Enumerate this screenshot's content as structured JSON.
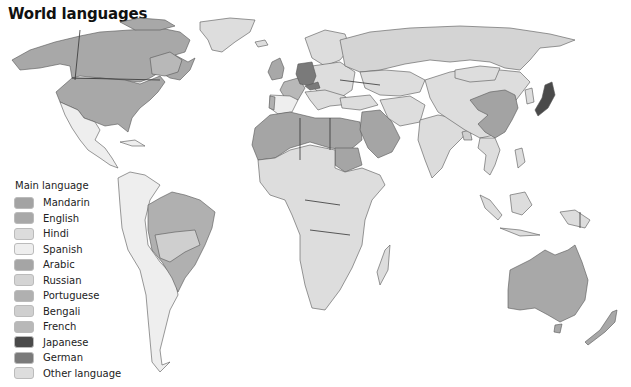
{
  "title": "World languages",
  "legend": {
    "title": "Main language",
    "items": [
      {
        "label": "Mandarin",
        "color": "#a3a3a3"
      },
      {
        "label": "English",
        "color": "#a8a8a8"
      },
      {
        "label": "Hindi",
        "color": "#dcdcdc"
      },
      {
        "label": "Spanish",
        "color": "#eeeeee"
      },
      {
        "label": "Arabic",
        "color": "#a5a5a5"
      },
      {
        "label": "Russian",
        "color": "#d4d4d4"
      },
      {
        "label": "Portuguese",
        "color": "#b0b0b0"
      },
      {
        "label": "Bengali",
        "color": "#cfcfcf"
      },
      {
        "label": "French",
        "color": "#b8b8b8"
      },
      {
        "label": "Japanese",
        "color": "#4a4a4a"
      },
      {
        "label": "German",
        "color": "#7a7a7a"
      },
      {
        "label": "Other language",
        "color": "#dddddd"
      }
    ]
  },
  "regions": {
    "north_america": "English",
    "quebec": "French",
    "mexico_central_america": "Spanish",
    "greenland": "Other language",
    "south_america": "Spanish",
    "brazil": "Portuguese",
    "europe_misc": "Other language",
    "uk": "English",
    "france": "French",
    "germany": "German",
    "spain": "Spanish",
    "russia": "Russian",
    "north_africa_middle_east": "Arabic",
    "sub_saharan_africa": "Other language",
    "china": "Mandarin",
    "india": "Hindi",
    "japan": "Japanese",
    "southeast_asia": "Other language",
    "australia_nz": "English"
  }
}
